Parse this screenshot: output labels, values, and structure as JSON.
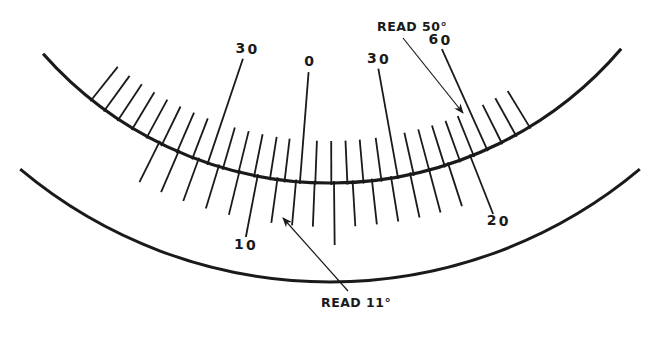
{
  "diagram": {
    "colors": {
      "ink": "#1a1a1a",
      "background": "#ffffff"
    },
    "geometry": {
      "center_x": 330,
      "center_y": -200,
      "main_arc_radius": 383,
      "outer_arc_radius": 482,
      "main_arc_span_deg": [
        -48.5,
        49.5
      ],
      "outer_arc_span_deg": [
        -40,
        40
      ]
    },
    "main_scale": {
      "description": "Upper ticks (outside the arc)",
      "ticks_deg": [
        -38.5,
        -36,
        -33.5,
        -31,
        -28.5,
        -26,
        -23.5,
        -21,
        -18.6,
        -16.2,
        -13.8,
        -11.4,
        -9,
        -6.8,
        -4.5,
        -2.2,
        0.2,
        2.6,
        5,
        7.7,
        10.2,
        12.6,
        15,
        17.4,
        19.8,
        22,
        24.2,
        26.6,
        29,
        31.4
      ],
      "major_ticks_deg": [
        -18.6,
        -4.5,
        10.2,
        24.2
      ],
      "labels": [
        {
          "text": "3",
          "text2": "0",
          "deg": -18.6
        },
        {
          "text": "0",
          "text2": "",
          "deg": -4.5
        },
        {
          "text": "3",
          "text2": "0",
          "deg": 10.2
        },
        {
          "text": "6",
          "text2": "0",
          "deg": 24.2
        }
      ]
    },
    "vernier_scale": {
      "description": "Lower ticks (inside the arc)",
      "ticks_deg": [
        -26.5,
        -23.3,
        -20.1,
        -16.9,
        -13.7,
        -10.9,
        -7.9,
        -5.1,
        -2.3,
        0.6,
        3.4,
        6.3,
        9.2,
        12.1,
        15,
        18,
        21.5
      ],
      "major_ticks_deg": [
        -10.9,
        0.6,
        21.5
      ],
      "labels": [
        {
          "text": "1",
          "text2": "0",
          "deg": -10.9
        },
        {
          "text": "2",
          "text2": "0",
          "deg": 21.5
        }
      ]
    },
    "callouts": [
      {
        "label": "READ 50°",
        "text_x": 377,
        "text_y": 31,
        "arrow_from": [
          403,
          38
        ],
        "arrow_to": [
          463,
          113
        ]
      },
      {
        "label": "READ 11°",
        "text_x": 321,
        "text_y": 307,
        "arrow_from": [
          348,
          291
        ],
        "arrow_to": [
          283,
          218
        ]
      }
    ]
  }
}
